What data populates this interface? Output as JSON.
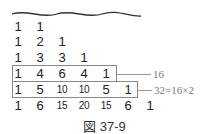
{
  "diagram": {
    "rows": [
      [
        "1",
        "1"
      ],
      [
        "1",
        "2",
        "1"
      ],
      [
        "1",
        "3",
        "3",
        "1"
      ],
      [
        "1",
        "4",
        "6",
        "4",
        "1"
      ],
      [
        "1",
        "5",
        "10",
        "10",
        "5",
        "1"
      ],
      [
        "1",
        "6",
        "15",
        "20",
        "15",
        "6",
        "1"
      ]
    ],
    "annotations": {
      "row4_sum": "16",
      "row5_sum": "32=16×2"
    },
    "caption": "図 37-9"
  }
}
